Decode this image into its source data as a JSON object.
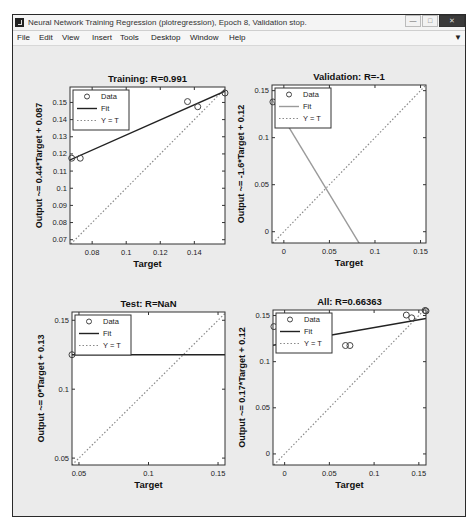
{
  "window": {
    "title": "Neural Network Training Regression (plotregression), Epoch 8, Validation stop.",
    "controls": [
      "minimize",
      "maximize",
      "close"
    ]
  },
  "menu": {
    "items": [
      "File",
      "Edit",
      "View",
      "Insert",
      "Tools",
      "Desktop",
      "Window",
      "Help"
    ]
  },
  "legend_labels": {
    "data": "Data",
    "fit": "Fit",
    "yt": "Y = T"
  },
  "chart_data": [
    {
      "type": "scatter",
      "title": "Training: R=0.991",
      "xlabel": "Target",
      "ylabel": "Output ~= 0.44*Target + 0.087",
      "xlim": [
        0.067,
        0.158
      ],
      "ylim": [
        0.0675,
        0.159
      ],
      "xticks": [
        0.08,
        0.1,
        0.12,
        0.14
      ],
      "xticklabels": [
        "0.08",
        "0.1",
        "0.12",
        "0.14"
      ],
      "yticks": [
        0.07,
        0.08,
        0.09,
        0.1,
        0.11,
        0.12,
        0.13,
        0.14,
        0.15
      ],
      "yticklabels": [
        "0.07",
        "0.08",
        "0.09",
        "0.1",
        "0.11",
        "0.12",
        "0.13",
        "0.14",
        "0.15"
      ],
      "points": [
        [
          0.068,
          0.1175
        ],
        [
          0.073,
          0.1175
        ],
        [
          0.136,
          0.1505
        ],
        [
          0.142,
          0.1475
        ],
        [
          0.158,
          0.1555
        ]
      ],
      "fit": {
        "slope": 0.44,
        "intercept": 0.087
      },
      "fit_color": "#222222",
      "legend": [
        "Data",
        "Fit",
        "Y = T"
      ],
      "grid": false
    },
    {
      "type": "scatter",
      "title": "Validation: R=-1",
      "xlabel": "Target",
      "ylabel": "Output ~= -1.6*Target + 0.12",
      "xlim": [
        -0.013,
        0.156
      ],
      "ylim": [
        -0.012,
        0.156
      ],
      "xticks": [
        0,
        0.05,
        0.1,
        0.15
      ],
      "xticklabels": [
        "0",
        "0.05",
        "0.1",
        "0.15"
      ],
      "yticks": [
        0,
        0.05,
        0.1,
        0.15
      ],
      "yticklabels": [
        "0",
        "0.05",
        "0.1",
        "0.15"
      ],
      "points": [
        [
          -0.012,
          0.138
        ]
      ],
      "fit": {
        "slope": -1.6,
        "intercept": 0.12
      },
      "fit_color": "#9a9a9a",
      "legend": [
        "Data",
        "Fit",
        "Y = T"
      ],
      "grid": false
    },
    {
      "type": "scatter",
      "title": "Test: R=NaN",
      "xlabel": "Target",
      "ylabel": "Output ~= 0*Target + 0.13",
      "xlim": [
        0.045,
        0.155
      ],
      "ylim": [
        0.045,
        0.156
      ],
      "xticks": [
        0.05,
        0.1,
        0.15
      ],
      "xticklabels": [
        "0.05",
        "0.1",
        "0.15"
      ],
      "yticks": [
        0.05,
        0.1,
        0.15
      ],
      "yticklabels": [
        "0.05",
        "0.1",
        "0.15"
      ],
      "points": [
        [
          0.045,
          0.125
        ]
      ],
      "fit": {
        "slope": 0,
        "intercept": 0.125
      },
      "fit_color": "#222222",
      "legend": [
        "Data",
        "Fit",
        "Y = T"
      ],
      "grid": false
    },
    {
      "type": "scatter",
      "title": "All: R=0.66363",
      "xlabel": "Target",
      "ylabel": "Output ~= 0.17*Target + 0.12",
      "xlim": [
        -0.013,
        0.158
      ],
      "ylim": [
        -0.012,
        0.156
      ],
      "xticks": [
        0,
        0.05,
        0.1,
        0.15
      ],
      "xticklabels": [
        "0",
        "0.05",
        "0.1",
        "0.15"
      ],
      "yticks": [
        0,
        0.05,
        0.1,
        0.15
      ],
      "yticklabels": [
        "0",
        "0.05",
        "0.1",
        "0.15"
      ],
      "points": [
        [
          -0.012,
          0.138
        ],
        [
          0.068,
          0.1175
        ],
        [
          0.073,
          0.1175
        ],
        [
          0.136,
          0.1505
        ],
        [
          0.142,
          0.1475
        ],
        [
          0.157,
          0.1555
        ],
        [
          0.158,
          0.155
        ]
      ],
      "fit": {
        "slope": 0.17,
        "intercept": 0.12
      },
      "fit_color": "#222222",
      "legend": [
        "Data",
        "Fit",
        "Y = T"
      ],
      "grid": false
    }
  ]
}
